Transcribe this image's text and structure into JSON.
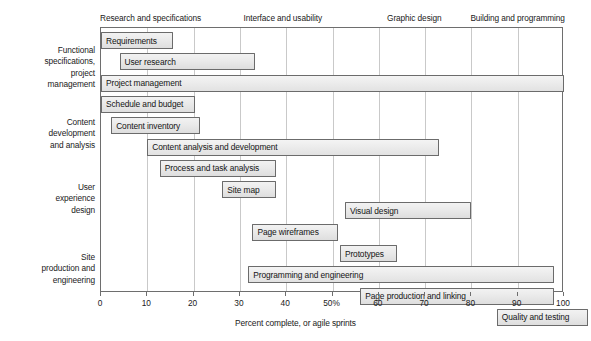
{
  "chart_data": {
    "type": "bar",
    "title": "",
    "subtitle": "",
    "xlabel": "Percent complete, or agile sprints",
    "ylabel": "",
    "xlim": [
      0,
      100
    ],
    "ylim": null,
    "grid": true,
    "legend_position": "none",
    "orientation": "horizontal",
    "chart_style": "gantt",
    "x_ticks": [
      {
        "value": 0,
        "label": "0"
      },
      {
        "value": 10,
        "label": "10"
      },
      {
        "value": 20,
        "label": "20"
      },
      {
        "value": 30,
        "label": "30"
      },
      {
        "value": 40,
        "label": "40"
      },
      {
        "value": 50,
        "label": "50%"
      },
      {
        "value": 60,
        "label": "60"
      },
      {
        "value": 70,
        "label": "70"
      },
      {
        "value": 80,
        "label": "80"
      },
      {
        "value": 90,
        "label": "90"
      },
      {
        "value": 100,
        "label": "100"
      }
    ],
    "phase_headers": [
      {
        "label": "Research and specifications",
        "x": 0
      },
      {
        "label": "Interface and usability",
        "x": 31
      },
      {
        "label": "Graphic design",
        "x": 62
      },
      {
        "label": "Building and programming",
        "x": 80
      }
    ],
    "categories": [
      "Functional specifications, project management",
      "Content development and analysis",
      "User experience design",
      "Site production and engineering"
    ],
    "category_label_lines": [
      [
        "Functional",
        "specifications,",
        "project",
        "management"
      ],
      [
        "Content",
        "development",
        "and analysis"
      ],
      [
        "User",
        "experience",
        "design"
      ],
      [
        "Site",
        "production and",
        "engineering"
      ]
    ],
    "tasks": [
      {
        "name": "Requirements",
        "start": 0,
        "end": 15.5,
        "category": "Functional specifications, project management"
      },
      {
        "name": "User research",
        "start": 4,
        "end": 33.3,
        "category": "Functional specifications, project management"
      },
      {
        "name": "Project management",
        "start": 0,
        "end": 100,
        "category": "Functional specifications, project management"
      },
      {
        "name": "Schedule and budget",
        "start": 0,
        "end": 20.2,
        "category": "Functional specifications, project management"
      },
      {
        "name": "Content inventory",
        "start": 2.2,
        "end": 21.3,
        "category": "Content development and analysis"
      },
      {
        "name": "Content analysis and development",
        "start": 10,
        "end": 73,
        "category": "Content development and analysis"
      },
      {
        "name": "Process and task analysis",
        "start": 12.7,
        "end": 37.8,
        "category": "Content development and analysis"
      },
      {
        "name": "Site map",
        "start": 26.2,
        "end": 37.8,
        "category": "User experience design"
      },
      {
        "name": "Visual design",
        "start": 52.7,
        "end": 80,
        "category": "User experience design"
      },
      {
        "name": "Page wireframes",
        "start": 32.7,
        "end": 51.1,
        "category": "User experience design"
      },
      {
        "name": "Prototypes",
        "start": 51.6,
        "end": 64,
        "category": "User experience design"
      },
      {
        "name": "Programming and engineering",
        "start": 31.8,
        "end": 97.8,
        "category": "Site production and engineering"
      },
      {
        "name": "Page production and linking",
        "start": 56,
        "end": 97.8,
        "category": "Site production and engineering"
      },
      {
        "name": "Quality and testing",
        "start": 85.5,
        "end": 105.2,
        "category": "Site production and engineering"
      }
    ],
    "colors": {
      "bar_fill": "#ebebeb",
      "bar_border": "#6b6b6b",
      "gridline": "#c9c9c9",
      "axis": "#6e6e6e",
      "text": "#1a1a1a",
      "background": "#ffffff"
    }
  }
}
